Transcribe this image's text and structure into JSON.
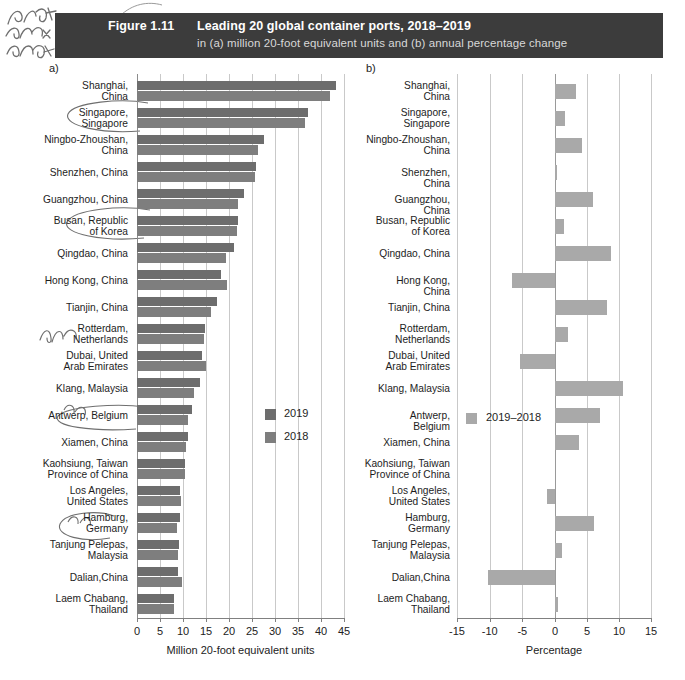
{
  "figure": {
    "number_label": "Figure 1.11",
    "title": "Leading 20 global container ports, 2018–2019",
    "subtitle": "in (a) million 20-foot equivalent units and (b) annual percentage change",
    "panel_a_letter": "a)",
    "panel_b_letter": "b)"
  },
  "panel_a": {
    "legend": [
      {
        "label": "2019",
        "color": "#6d6d6d"
      },
      {
        "label": "2018",
        "color": "#7e7e7e"
      }
    ],
    "xlabel": "Million 20-foot equivalent units",
    "xticks": [
      "0",
      "5",
      "10",
      "15",
      "20",
      "25",
      "30",
      "35",
      "40",
      "45"
    ]
  },
  "panel_b": {
    "legend": [
      {
        "label": "2019–2018",
        "color": "#a9a9a9"
      }
    ],
    "xlabel": "Percentage",
    "xticks": [
      "-15",
      "-10",
      "-5",
      "0",
      "5",
      "10",
      "15"
    ]
  },
  "chart_data": [
    {
      "type": "bar",
      "orientation": "horizontal",
      "panel": "a",
      "title": "Leading 20 global container ports, 2018–2019",
      "xlabel": "Million 20-foot equivalent units",
      "ylabel": "",
      "xlim": [
        0,
        45
      ],
      "grid": true,
      "legend_position": "inside-right",
      "categories": [
        "Shanghai, China",
        "Singapore, Singapore",
        "Ningbo-Zhoushan, China",
        "Shenzhen, China",
        "Guangzhou, China",
        "Busan, Republic of Korea",
        "Qingdao, China",
        "Hong Kong, China",
        "Tianjin, China",
        "Rotterdam, Netherlands",
        "Dubai, United Arab Emirates",
        "Klang, Malaysia",
        "Antwerp, Belgium",
        "Xiamen, China",
        "Kaohsiung, Taiwan Province of China",
        "Los Angeles, United States",
        "Hamburg, Germany",
        "Tanjung Pelepas, Malaysia",
        "Dalian, China",
        "Laem Chabang, Thailand"
      ],
      "series": [
        {
          "name": "2019",
          "color": "#6d6d6d",
          "values": [
            43.3,
            37.2,
            27.5,
            25.8,
            23.2,
            22.0,
            21.0,
            18.3,
            17.3,
            14.8,
            14.1,
            13.6,
            11.9,
            11.1,
            10.4,
            9.3,
            9.3,
            9.1,
            8.8,
            8.0
          ]
        },
        {
          "name": "2018",
          "color": "#7e7e7e",
          "values": [
            42.0,
            36.6,
            26.4,
            25.7,
            21.9,
            21.7,
            19.3,
            19.6,
            16.0,
            14.5,
            14.9,
            12.3,
            11.1,
            10.7,
            10.4,
            9.5,
            8.7,
            9.0,
            9.8,
            8.0
          ]
        }
      ]
    },
    {
      "type": "bar",
      "orientation": "horizontal",
      "panel": "b",
      "title": "Annual percentage change",
      "xlabel": "Percentage",
      "ylabel": "",
      "xlim": [
        -15,
        15
      ],
      "grid": true,
      "legend_position": "inside-left",
      "categories": [
        "Shanghai, China",
        "Singapore, Singapore",
        "Ningbo-Zhoushan, China",
        "Shenzhen, China",
        "Guangzhou, China",
        "Busan, Republic of Korea",
        "Qingdao, China",
        "Hong Kong, China",
        "Tianjin, China",
        "Rotterdam, Netherlands",
        "Dubai, United Arab Emirates",
        "Klang, Malaysia",
        "Antwerp, Belgium",
        "Xiamen, China",
        "Kaohsiung, Taiwan Province of China",
        "Los Angeles, United States",
        "Hamburg, Germany",
        "Tanjung Pelepas, Malaysia",
        "Dalian, China",
        "Laem Chabang, Thailand"
      ],
      "series": [
        {
          "name": "2019–2018",
          "color": "#a9a9a9",
          "values": [
            3.2,
            1.6,
            4.2,
            0.3,
            5.9,
            1.4,
            8.8,
            -6.6,
            8.1,
            2.0,
            -5.4,
            10.6,
            7.0,
            3.7,
            0.0,
            -1.3,
            6.1,
            1.1,
            -10.2,
            0.4
          ]
        }
      ]
    }
  ]
}
